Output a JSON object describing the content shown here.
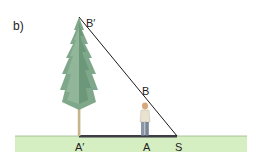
{
  "figure": {
    "panel_label": "b)",
    "points": {
      "tree_top": "B′",
      "person_top": "B",
      "tree_base": "A′",
      "person_base": "A",
      "light_source": "S"
    }
  },
  "colors": {
    "ground": "#d6efc2",
    "ground_edge": "#9bb58a",
    "shadow": "#3d3d45",
    "line": "#1a1a1a",
    "tree_foliage": "#7fa88a",
    "tree_foliage_dark": "#5d8a6c",
    "trunk": "#c9b48a",
    "person_pants": "#8b97a8",
    "person_shirt": "#e8e2d0",
    "person_skin": "#d9a77a"
  }
}
